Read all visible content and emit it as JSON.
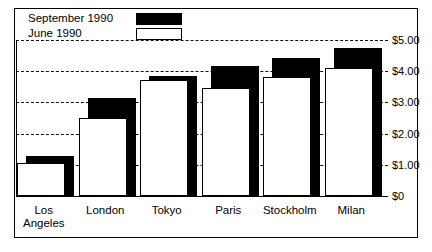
{
  "chart": {
    "type": "bar",
    "title": "",
    "xlabel": "",
    "ylabel": "",
    "legend_position": "top-left",
    "grid": true,
    "ylim": [
      0,
      5
    ],
    "ytick_labels": [
      "$5.00",
      "$4.00",
      "$3.00",
      "$2.00",
      "$1.00",
      "$0"
    ],
    "ytick_values": [
      5,
      4,
      3,
      2,
      1,
      0
    ]
  },
  "legend": {
    "items": [
      {
        "label": "September 1990",
        "swatch": "filled",
        "color": "#000000"
      },
      {
        "label": "June 1990",
        "swatch": "empty",
        "color": "#ffffff"
      }
    ]
  },
  "chart_data": {
    "type": "bar",
    "title": "",
    "xlabel": "",
    "ylabel": "",
    "ylim": [
      0,
      5
    ],
    "grid": true,
    "legend_position": "top-left",
    "yticks": [
      0,
      1,
      2,
      3,
      4,
      5
    ],
    "ytick_labels": [
      "$0",
      "$1.00",
      "$2.00",
      "$3.00",
      "$4.00",
      "$5.00"
    ],
    "categories": [
      "Los Angeles",
      "London",
      "Tokyo",
      "Paris",
      "Stockholm",
      "Milan"
    ],
    "series": [
      {
        "name": "September 1990",
        "color": "#000000",
        "values": [
          1.28,
          3.14,
          3.85,
          4.17,
          4.42,
          4.74
        ]
      },
      {
        "name": "June 1990",
        "color": "#ffffff",
        "values": [
          1.06,
          2.5,
          3.72,
          3.46,
          3.81,
          4.1
        ]
      }
    ]
  },
  "xaxis": {
    "labels": [
      "Los\nAngeles",
      "London",
      "Tokyo",
      "Paris",
      "Stockholm",
      "Milan"
    ]
  }
}
